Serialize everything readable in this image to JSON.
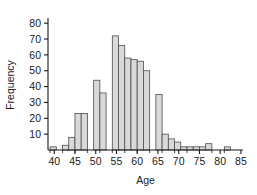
{
  "chart_data": {
    "type": "bar",
    "title": "",
    "subtitle": "",
    "xlabel": "Age",
    "ylabel": "Frequency",
    "xlim": [
      38.5,
      85.5
    ],
    "ylim": [
      0,
      82
    ],
    "grid": false,
    "legend": null,
    "bin_width": 1.5,
    "bar_fill_color": "#d9d9d9",
    "bar_edge_color": "#4d4d4d",
    "axis_color": "#1a1a1a",
    "xticks": [
      40,
      45,
      50,
      55,
      60,
      65,
      70,
      75,
      80,
      85
    ],
    "xtick_labels": [
      "40",
      "45",
      "50",
      "55",
      "60",
      "65",
      "70",
      "75",
      "80",
      "85"
    ],
    "yticks": [
      10,
      20,
      30,
      40,
      50,
      60,
      70,
      80
    ],
    "ytick_labels": [
      "10",
      "20",
      "30",
      "40",
      "50",
      "60",
      "70",
      "80"
    ],
    "bin_starts": [
      39.0,
      40.5,
      42.0,
      43.5,
      45.0,
      46.5,
      48.0,
      49.5,
      51.0,
      52.5,
      54.0,
      55.5,
      57.0,
      58.5,
      60.0,
      61.5,
      63.0,
      64.5,
      66.0,
      67.5,
      69.0,
      70.5,
      72.0,
      73.5,
      75.0,
      76.5,
      78.0,
      79.5,
      81.0,
      82.5
    ],
    "categories": [
      "39.0-40.5",
      "40.5-42.0",
      "42.0-43.5",
      "43.5-45.0",
      "45.0-46.5",
      "46.5-48.0",
      "48.0-49.5",
      "49.5-51.0",
      "51.0-52.5",
      "52.5-54.0",
      "54.0-55.5",
      "55.5-57.0",
      "57.0-58.5",
      "58.5-60.0",
      "60.0-61.5",
      "61.5-63.0",
      "63.0-64.5",
      "64.5-66.0",
      "66.0-67.5",
      "67.5-69.0",
      "69.0-70.5",
      "70.5-72.0",
      "72.0-73.5",
      "73.5-75.0",
      "75.0-76.5",
      "76.5-78.0",
      "78.0-79.5",
      "79.5-81.0",
      "81.0-82.5",
      "82.5-84.0"
    ],
    "values": [
      2,
      0,
      3,
      8,
      23,
      23,
      0,
      44,
      36,
      0,
      72,
      66,
      58,
      57,
      56,
      50,
      0,
      35,
      10,
      7,
      5,
      2,
      2,
      2,
      2,
      4,
      0,
      0,
      2,
      0
    ]
  }
}
